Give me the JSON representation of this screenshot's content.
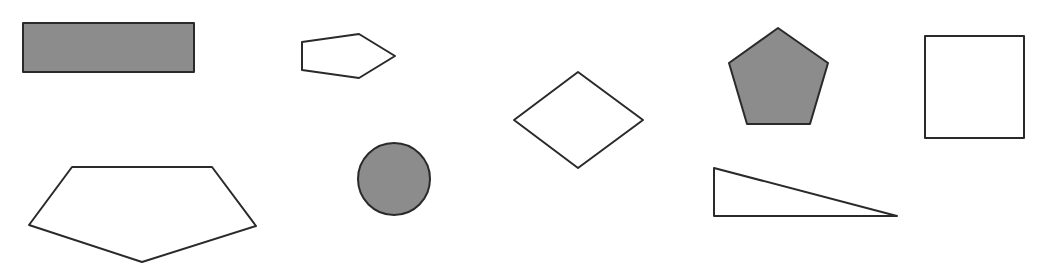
{
  "canvas": {
    "width": 1052,
    "height": 268,
    "background": "#ffffff"
  },
  "colors": {
    "stroke": "#2a2a2a",
    "fill_gray": "#8c8c8c",
    "fill_white": "#ffffff"
  },
  "shapes": [
    {
      "id": "filled-rectangle",
      "type": "rect",
      "x": 23,
      "y": 23,
      "w": 171,
      "h": 49,
      "fill": "#8c8c8c"
    },
    {
      "id": "small-pentagon",
      "type": "polygon",
      "points": "302,42 359,34 395,56 359,78 302,70",
      "fill": "#ffffff"
    },
    {
      "id": "diamond",
      "type": "polygon",
      "points": "578,72 643,120 578,168 514,120",
      "fill": "#ffffff"
    },
    {
      "id": "filled-pentagon",
      "type": "polygon",
      "points": "778,28 828,63 810,124 747,124 729,63",
      "fill": "#8c8c8c"
    },
    {
      "id": "square",
      "type": "rect",
      "x": 925,
      "y": 36,
      "w": 99,
      "h": 102,
      "fill": "#ffffff"
    },
    {
      "id": "large-pentagon",
      "type": "polygon",
      "points": "72,167 212,167 256,226 142,262 29,225",
      "fill": "#ffffff"
    },
    {
      "id": "filled-circle",
      "type": "circle",
      "cx": 394,
      "cy": 179,
      "r": 36,
      "fill": "#8c8c8c"
    },
    {
      "id": "right-triangle",
      "type": "polygon",
      "points": "714,168 714,216 897,216",
      "fill": "#ffffff"
    }
  ]
}
